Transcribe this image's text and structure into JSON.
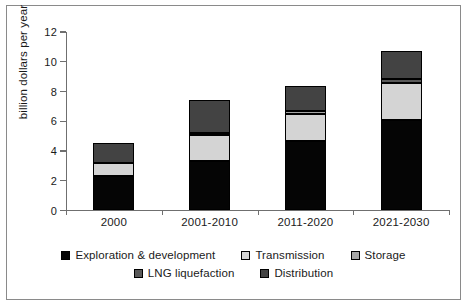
{
  "chart_data": {
    "type": "bar",
    "subtype": "stacked-bar",
    "title": "",
    "xlabel": "",
    "ylabel": "billion dollars per year",
    "categories": [
      "2000",
      "2001-2010",
      "2011-2020",
      "2021-2030"
    ],
    "ylim": [
      0,
      12
    ],
    "yticks": [
      0,
      2,
      4,
      6,
      8,
      10,
      12
    ],
    "grid": false,
    "legend_position": "bottom",
    "series": [
      {
        "name": "Exploration & development",
        "color": "#050505",
        "values": [
          2.35,
          3.35,
          4.65,
          6.1
        ]
      },
      {
        "name": "Transmission",
        "color": "#d4d4d4",
        "values": [
          0.85,
          1.75,
          1.85,
          2.5
        ]
      },
      {
        "name": "Storage",
        "color": "#a6a6a6",
        "values": [
          0.0,
          0.12,
          0.2,
          0.0
        ]
      },
      {
        "name": "LNG liquefaction",
        "color": "#595959",
        "values": [
          0.0,
          0.0,
          0.0,
          0.25
        ]
      },
      {
        "name": "Distribution",
        "color": "#434343",
        "values": [
          1.35,
          2.18,
          1.7,
          1.85
        ]
      }
    ],
    "totals": [
      4.55,
      7.4,
      8.4,
      10.7
    ]
  },
  "axis": {
    "y_ticks": [
      "12",
      "10",
      "8",
      "6",
      "4",
      "2",
      "0"
    ],
    "y_title": "billion dollars per year",
    "x_ticks": [
      "2000",
      "2001-2010",
      "2011-2020",
      "2021-2030"
    ]
  },
  "legend": {
    "row1": [
      {
        "label": "Exploration & development",
        "color": "#050505"
      },
      {
        "label": "Transmission",
        "color": "#d4d4d4"
      },
      {
        "label": "Storage",
        "color": "#a6a6a6"
      }
    ],
    "row2": [
      {
        "label": "LNG liquefaction",
        "color": "#595959"
      },
      {
        "label": "Distribution",
        "color": "#434343"
      }
    ]
  },
  "colors": {
    "frame": "#8a8a8a",
    "axis": "#6f6f6f",
    "text": "#1a1a1a",
    "background": "#ffffff"
  }
}
